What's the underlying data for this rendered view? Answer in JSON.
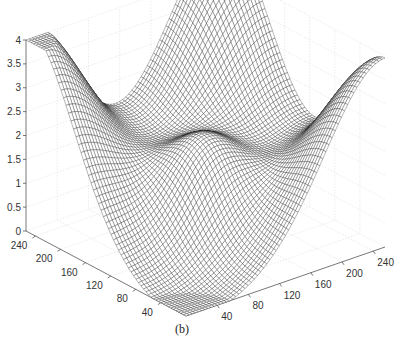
{
  "chart_data": {
    "type": "surface",
    "title": "",
    "caption": "(b)",
    "xlabel": "",
    "ylabel": "",
    "zlabel": "",
    "x_ticks": [
      40,
      80,
      120,
      160,
      200,
      240
    ],
    "y_ticks": [
      240,
      200,
      160,
      120,
      80,
      40
    ],
    "z_ticks": [
      0,
      0.5,
      1,
      1.5,
      2,
      2.5,
      3,
      3.5,
      4
    ],
    "x_range": [
      0,
      255
    ],
    "y_range": [
      0,
      255
    ],
    "zlim": [
      0,
      4
    ],
    "grid": true,
    "style": "black wireframe mesh",
    "surface_description": "Saddle-like surface with maxima ~4 at back and left corners, ~3.6 at right corner, a central bump ~2.5, and a deep valley near the front corner approaching 0",
    "key_points": [
      {
        "x": 0,
        "y": 255,
        "z": 4.0
      },
      {
        "x": 255,
        "y": 255,
        "z": 4.0
      },
      {
        "x": 255,
        "y": 0,
        "z": 3.6
      },
      {
        "x": 128,
        "y": 128,
        "z": 2.5
      },
      {
        "x": 0,
        "y": 0,
        "z": 0.1
      }
    ]
  },
  "labels": {
    "caption": "(b)",
    "z_ticks": [
      "0",
      "0.5",
      "1",
      "1.5",
      "2",
      "2.5",
      "3",
      "3.5",
      "4"
    ],
    "left_ticks": [
      "240",
      "200",
      "160",
      "120",
      "80",
      "40"
    ],
    "right_ticks": [
      "40",
      "80",
      "120",
      "160",
      "200",
      "240"
    ]
  },
  "colors": {
    "mesh": "#1a1a1a",
    "axis": "#555555",
    "grid": "#e2e2e2"
  }
}
